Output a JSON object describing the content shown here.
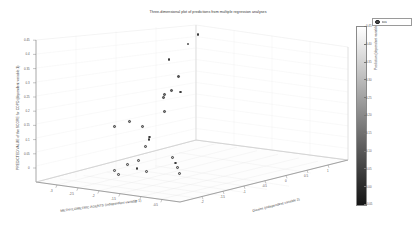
{
  "figure": {
    "title": "Three-dimensional plot of predictions from multiple regression analyses",
    "background": "#ffffff"
  },
  "legend": {
    "marker_name": "filled-circle-marker",
    "label": "data",
    "marker_color": "#4a4a4a"
  },
  "colorbar": {
    "label": "Prediction (dependent variable)",
    "orientation": "vertical",
    "low_color": "#ffffff",
    "high_color": "#151515",
    "ticks": [
      "0.45",
      "0.40",
      "0.35",
      "0.30",
      "0.25",
      "0.20",
      "0.15",
      "0.10",
      "0.05",
      "0.00",
      "-0.05"
    ],
    "tick_values": [
      0.45,
      0.4,
      0.35,
      0.3,
      0.25,
      0.2,
      0.15,
      0.1,
      0.05,
      0.0,
      -0.05
    ]
  },
  "chart_data": {
    "type": "scatter",
    "title": "Three-dimensional plot of predictions from multiple regression analyses",
    "xlabel": "METHYLOMETRIC AGENTS (independent variable 1)",
    "ylabel": "Dioxins (independent variable 2)",
    "zlabel": "PREDICTED VALUE of the SCORE for COPD (dependent variable 1)",
    "colorbar_label": "Prediction (dependent variable)",
    "projection": "3d",
    "grid": true,
    "legend_position": "top-right",
    "xlim": [
      -3.0,
      2.0
    ],
    "ylim": [
      -2.0,
      3.0
    ],
    "zlim": [
      -0.05,
      0.45
    ],
    "xticks": [
      "-3",
      "-2.5",
      "-2",
      "-1.5",
      "-1",
      "-0.5",
      "0",
      "0.5",
      "1"
    ],
    "yticks": [
      "-2",
      "-1.5",
      "-1",
      "-0.5",
      "0",
      "0.5",
      "1",
      "1.5",
      "2"
    ],
    "zticks": [
      "0",
      "0.05",
      "0.1",
      "0.15",
      "0.2",
      "0.25",
      "0.3",
      "0.35",
      "0.4",
      "0.45"
    ],
    "points": [
      {
        "x": -0.35,
        "y": 0.55,
        "z": 0.43,
        "c": 0.43
      },
      {
        "x": -0.52,
        "y": 0.4,
        "z": 0.4,
        "c": 0.4
      },
      {
        "x": -0.95,
        "y": 0.2,
        "z": 0.345,
        "c": 0.345
      },
      {
        "x": -0.6,
        "y": 0.18,
        "z": 0.29,
        "c": 0.29
      },
      {
        "x": -0.7,
        "y": 0.05,
        "z": 0.245,
        "c": 0.245
      },
      {
        "x": -0.45,
        "y": 0.12,
        "z": 0.24,
        "c": 0.24
      },
      {
        "x": -0.82,
        "y": -0.05,
        "z": 0.232,
        "c": 0.232
      },
      {
        "x": -0.8,
        "y": -0.1,
        "z": 0.222,
        "c": 0.222
      },
      {
        "x": -0.62,
        "y": -0.22,
        "z": 0.178,
        "c": 0.178
      },
      {
        "x": -1.55,
        "y": -0.45,
        "z": 0.138,
        "c": 0.138
      },
      {
        "x": -1.05,
        "y": -0.5,
        "z": 0.128,
        "c": 0.128
      },
      {
        "x": -1.92,
        "y": -0.6,
        "z": 0.118,
        "c": 0.118
      },
      {
        "x": -0.55,
        "y": -0.72,
        "z": 0.105,
        "c": 0.105
      },
      {
        "x": -0.5,
        "y": -0.78,
        "z": 0.098,
        "c": 0.098
      },
      {
        "x": -0.42,
        "y": -0.95,
        "z": 0.08,
        "c": 0.08
      },
      {
        "x": 0.62,
        "y": -1.05,
        "z": 0.06,
        "c": 0.06
      },
      {
        "x": 0.9,
        "y": -1.2,
        "z": 0.048,
        "c": 0.048
      },
      {
        "x": -0.28,
        "y": -1.28,
        "z": 0.042,
        "c": 0.042
      },
      {
        "x": 1.12,
        "y": -1.32,
        "z": 0.038,
        "c": 0.038
      },
      {
        "x": -0.52,
        "y": -1.4,
        "z": 0.03,
        "c": 0.03
      },
      {
        "x": 1.35,
        "y": -1.45,
        "z": 0.026,
        "c": 0.026
      },
      {
        "x": -0.1,
        "y": -1.48,
        "z": 0.022,
        "c": 0.022
      },
      {
        "x": 0.28,
        "y": -1.52,
        "z": 0.018,
        "c": 0.018
      },
      {
        "x": -0.72,
        "y": -1.62,
        "z": 0.01,
        "c": 0.01
      },
      {
        "x": -0.45,
        "y": -1.72,
        "z": 0.004,
        "c": 0.004
      }
    ]
  },
  "axes": {
    "z_tick_labels": [
      "0.45",
      "0.4",
      "0.35",
      "0.3",
      "0.25",
      "0.2",
      "0.15",
      "0.1",
      "0.05",
      "0"
    ],
    "x_tick_labels": [
      "-3",
      "-2.5",
      "-2",
      "-1.5",
      "-1",
      "-0.5",
      "0"
    ],
    "y_tick_labels": [
      "-2",
      "-1.5",
      "-1",
      "-0.5",
      "0",
      "0.5",
      "1",
      "1.5",
      "2"
    ],
    "z_axis_label": "PREDICTED VALUE of the SCORE for COPD (dependent variable 1)",
    "x_axis_label": "METHYLOMETRIC AGENTS (independent variable 1)",
    "y_axis_label": "Dioxins (independent variable 2)"
  }
}
